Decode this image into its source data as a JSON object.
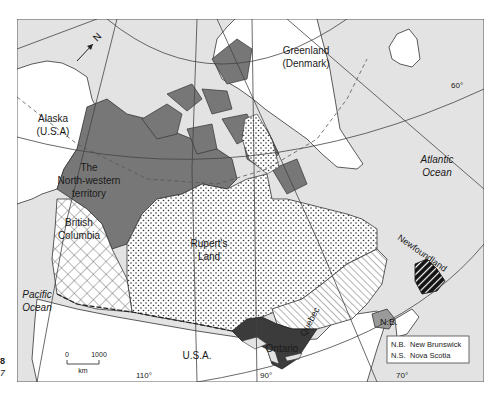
{
  "map": {
    "title": "Canada territories map",
    "regions": [
      {
        "id": "north-western-territory",
        "label": "The North-western territory",
        "lines": [
          "The",
          "North-western",
          "territory"
        ],
        "fill": "#777777",
        "pattern": "solid-dark"
      },
      {
        "id": "rupert-land",
        "label": "Rupert's Land",
        "lines": [
          "Rupert's",
          "Land"
        ],
        "fill": "#ffffff",
        "pattern": "dots"
      },
      {
        "id": "british-columbia",
        "label": "British Columbia",
        "lines": [
          "British",
          "Columbia"
        ],
        "fill": "#ffffff",
        "pattern": "crosshatch"
      },
      {
        "id": "quebec",
        "label": "Quebec",
        "fill": "#ffffff",
        "pattern": "diagonal-stripes"
      },
      {
        "id": "ontario",
        "label": "Ontario",
        "fill": "#3d3d3d",
        "pattern": "solid-black"
      },
      {
        "id": "new-brunswick",
        "label": "N.B.",
        "fill": "#9a9a9a",
        "pattern": "solid-mid"
      },
      {
        "id": "nova-scotia",
        "label": "N.S.",
        "fill": "#ffffff",
        "pattern": "plain"
      },
      {
        "id": "newfoundland",
        "label": "Newfoundland",
        "fill": "#111111",
        "pattern": "black-white-stripes"
      }
    ],
    "other_labels": {
      "alaska": [
        "Alaska",
        "(U.S.A)"
      ],
      "greenland": [
        "Greenland",
        "(Denmark)"
      ],
      "usa": "U.S.A.",
      "pacific": [
        "Pacific",
        "Ocean"
      ],
      "atlantic": [
        "Atlantic",
        "Ocean"
      ]
    },
    "graticule_labels": {
      "lat_60": "60°",
      "lat_40": "40°",
      "lon_110": "110°",
      "lon_90": "90°",
      "lon_70": "70°"
    },
    "north_arrow": "N",
    "scale_bar": {
      "start": "0",
      "end": "1000",
      "unit": "km"
    },
    "legend": [
      {
        "abbr": "N.B.",
        "name": "New Brunswick"
      },
      {
        "abbr": "N.S.",
        "name": "Nova Scotia"
      }
    ],
    "colors": {
      "ocean": "#e3e3e3",
      "foreign_land": "#ffffff",
      "dark_territory": "#777777",
      "ontario": "#3b3b3b",
      "border": "#333333"
    },
    "margin_fragments": [
      "8",
      "7"
    ]
  }
}
